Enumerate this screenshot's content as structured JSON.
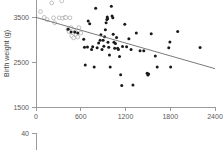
{
  "chart_data": {
    "type": "scatter",
    "title": "",
    "xlabel": "",
    "ylabel": "Birth weight (g)",
    "xlim": [
      0,
      2400
    ],
    "ylim": [
      1500,
      3900
    ],
    "xticks": [
      0,
      600,
      1200,
      1800,
      2400
    ],
    "yticks": [
      1500,
      2500,
      3500
    ],
    "xtick_labels": [
      "0",
      "600",
      "1200",
      "1800",
      "2400"
    ],
    "ytick_labels": [
      "1500",
      "2500",
      "3500"
    ],
    "grid": false,
    "legend": "none",
    "series": [
      {
        "name": "open-circles",
        "marker": "open circle",
        "color": "#a8a8a8",
        "points": [
          [
            60,
            3640
          ],
          [
            110,
            3510
          ],
          [
            150,
            3460
          ],
          [
            210,
            3835
          ],
          [
            235,
            3500
          ],
          [
            250,
            3390
          ],
          [
            300,
            3960
          ],
          [
            310,
            3500
          ],
          [
            345,
            3880
          ],
          [
            355,
            3490
          ],
          [
            390,
            3510
          ],
          [
            400,
            3505
          ],
          [
            430,
            3240
          ],
          [
            445,
            3190
          ],
          [
            455,
            3500
          ],
          [
            470,
            3280
          ],
          [
            480,
            3090
          ],
          [
            505,
            3050
          ],
          [
            520,
            3195
          ],
          [
            540,
            3120
          ],
          [
            560,
            3070
          ],
          [
            575,
            3280
          ],
          [
            600,
            3160
          ]
        ]
      },
      {
        "name": "filled-circles",
        "marker": "filled circle",
        "color": "#1a1a1a",
        "points": [
          [
            430,
            3245
          ],
          [
            470,
            3185
          ],
          [
            520,
            3185
          ],
          [
            560,
            3160
          ],
          [
            640,
            3020
          ],
          [
            650,
            2840
          ],
          [
            660,
            2440
          ],
          [
            690,
            2845
          ],
          [
            700,
            3430
          ],
          [
            720,
            3370
          ],
          [
            745,
            2790
          ],
          [
            760,
            2850
          ],
          [
            780,
            2400
          ],
          [
            800,
            3715
          ],
          [
            820,
            2830
          ],
          [
            840,
            2935
          ],
          [
            860,
            3000
          ],
          [
            870,
            3120
          ],
          [
            885,
            2790
          ],
          [
            900,
            3000
          ],
          [
            910,
            2860
          ],
          [
            920,
            3075
          ],
          [
            930,
            3230
          ],
          [
            940,
            3390
          ],
          [
            950,
            3465
          ],
          [
            955,
            3520
          ],
          [
            960,
            3480
          ],
          [
            965,
            2955
          ],
          [
            975,
            2840
          ],
          [
            985,
            2665
          ],
          [
            995,
            2400
          ],
          [
            1010,
            3760
          ],
          [
            1020,
            3540
          ],
          [
            1030,
            3500
          ],
          [
            1035,
            3130
          ],
          [
            1045,
            2950
          ],
          [
            1055,
            2820
          ],
          [
            1065,
            2925
          ],
          [
            1080,
            3060
          ],
          [
            1095,
            2820
          ],
          [
            1105,
            2790
          ],
          [
            1120,
            2630
          ],
          [
            1135,
            2225
          ],
          [
            1150,
            1980
          ],
          [
            1160,
            2855
          ],
          [
            1190,
            3355
          ],
          [
            1215,
            2850
          ],
          [
            1245,
            3030
          ],
          [
            1275,
            2790
          ],
          [
            1300,
            1995
          ],
          [
            1345,
            3160
          ],
          [
            1395,
            2760
          ],
          [
            1445,
            2760
          ],
          [
            1490,
            2255
          ],
          [
            1500,
            2215
          ],
          [
            1510,
            2240
          ],
          [
            1545,
            3145
          ],
          [
            1600,
            2645
          ],
          [
            1625,
            2400
          ],
          [
            1780,
            2830
          ],
          [
            1795,
            2960
          ],
          [
            1805,
            2400
          ],
          [
            1900,
            3195
          ],
          [
            2200,
            2835
          ]
        ]
      }
    ],
    "regression_line": {
      "x_start": 0,
      "y_start": 3510,
      "x_end": 2400,
      "y_end": 2360,
      "color": "#6b6b6b"
    }
  },
  "bottom_panel": {
    "ytick_label": "40"
  }
}
